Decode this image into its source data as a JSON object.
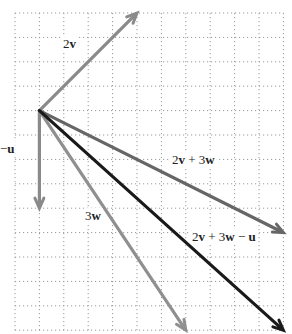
{
  "diagram": {
    "type": "vector-addition-grid",
    "grid": {
      "origin_px": [
        15,
        13
      ],
      "spacing_px": 24.4,
      "cols": 11,
      "rows": 13,
      "line_color": "#9a9a9a",
      "style": "dotted"
    },
    "origin": {
      "col": 1,
      "row": 4
    },
    "vectors": [
      {
        "id": "2v",
        "label": "2v",
        "label_parts": [
          {
            "t": "2"
          },
          {
            "t": "v",
            "b": true
          }
        ],
        "components": [
          4,
          4
        ],
        "color": "#8a8a8a",
        "label_pos": [
          63,
          48
        ]
      },
      {
        "id": "neg-u",
        "label": "−u",
        "label_parts": [
          {
            "t": "−"
          },
          {
            "t": "u",
            "b": true
          }
        ],
        "components": [
          0,
          -4
        ],
        "color": "#8a8a8a",
        "label_pos": [
          0,
          153
        ]
      },
      {
        "id": "3w",
        "label": "3w",
        "label_parts": [
          {
            "t": "3"
          },
          {
            "t": "w",
            "b": true
          }
        ],
        "components": [
          6,
          -9
        ],
        "color": "#8f8f8f",
        "label_pos": [
          85,
          220
        ]
      },
      {
        "id": "2v+3w",
        "label": "2v + 3w",
        "label_parts": [
          {
            "t": "2"
          },
          {
            "t": "v",
            "b": true
          },
          {
            "t": " + 3"
          },
          {
            "t": "w",
            "b": true
          }
        ],
        "components": [
          10,
          -5
        ],
        "color": "#666666",
        "label_pos": [
          172,
          164
        ]
      },
      {
        "id": "2v+3w-u",
        "label": "2v + 3w − u",
        "label_parts": [
          {
            "t": "2"
          },
          {
            "t": "v",
            "b": true
          },
          {
            "t": " + 3"
          },
          {
            "t": "w",
            "b": true
          },
          {
            "t": " − "
          },
          {
            "t": "u",
            "b": true
          }
        ],
        "components": [
          10,
          -9
        ],
        "color": "#1a1a1a",
        "label_pos": [
          192,
          241
        ]
      }
    ]
  }
}
